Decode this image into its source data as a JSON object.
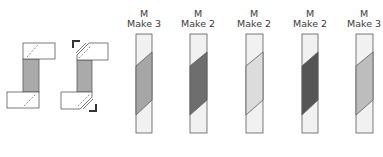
{
  "diagram": {
    "steps": [
      {
        "id": "sew-step",
        "description": "Two rectangles sewn at ends of gray strip with diagonal stitch lines"
      },
      {
        "id": "trim-step",
        "description": "Same unit with corner triangles trimmed"
      }
    ],
    "units": [
      {
        "label_top": "M",
        "label_bottom": "Make 3",
        "fill": "#a6a6a6"
      },
      {
        "label_top": "M",
        "label_bottom": "Make 2",
        "fill": "#6e6e6e"
      },
      {
        "label_top": "M",
        "label_bottom": "Make 2",
        "fill": "#dcdcdc"
      },
      {
        "label_top": "M",
        "label_bottom": "Make 2",
        "fill": "#555555"
      },
      {
        "label_top": "M",
        "label_bottom": "Make 3",
        "fill": "#bdbdbd"
      }
    ],
    "colors": {
      "outline": "#5a5a5a",
      "background_fabric": "#f1f1f1",
      "step_strip": "#aaaaaa",
      "trim_triangle": "#333333"
    }
  }
}
